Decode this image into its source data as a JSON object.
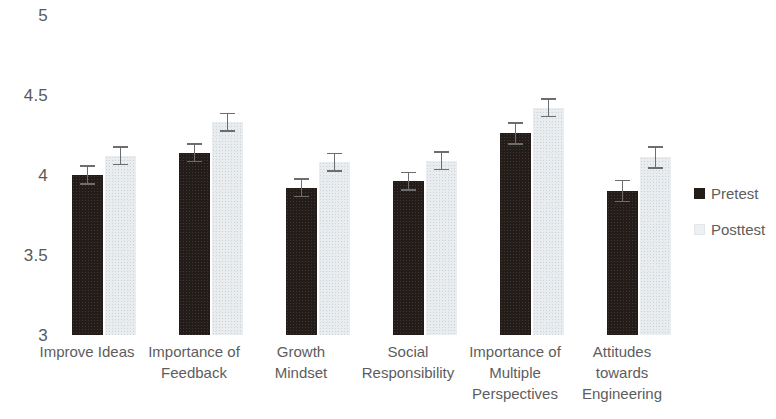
{
  "chart_data": {
    "type": "bar",
    "title": "",
    "subtitle": "",
    "xlabel": "",
    "ylabel": "",
    "ylim": [
      3,
      5
    ],
    "yticks": [
      3,
      3.5,
      4,
      4.5,
      5
    ],
    "ytick_labels": [
      "3",
      "3.5",
      "4",
      "4.5",
      "5"
    ],
    "grid": false,
    "legend_position": "right",
    "categories": [
      "Improve Ideas",
      "Importance of\nFeedback",
      "Growth\nMindset",
      "Social\nResponsibility",
      "Importance of\nMultiple\nPerspectives",
      "Attitudes\ntowards\nEngineering"
    ],
    "series": [
      {
        "name": "Pretest",
        "color": "#231c19",
        "values": [
          4.0,
          4.14,
          3.92,
          3.96,
          4.26,
          3.9
        ],
        "errors": [
          0.06,
          0.06,
          0.06,
          0.06,
          0.07,
          0.07
        ]
      },
      {
        "name": "Posttest",
        "color": "#e9edef",
        "values": [
          4.12,
          4.33,
          4.08,
          4.09,
          4.42,
          4.11
        ],
        "errors": [
          0.06,
          0.06,
          0.06,
          0.06,
          0.06,
          0.07
        ]
      }
    ]
  },
  "legend": {
    "items": [
      {
        "label": "Pretest",
        "swatch": "pretest-swatch"
      },
      {
        "label": "Posttest",
        "swatch": "posttest-swatch"
      }
    ]
  }
}
